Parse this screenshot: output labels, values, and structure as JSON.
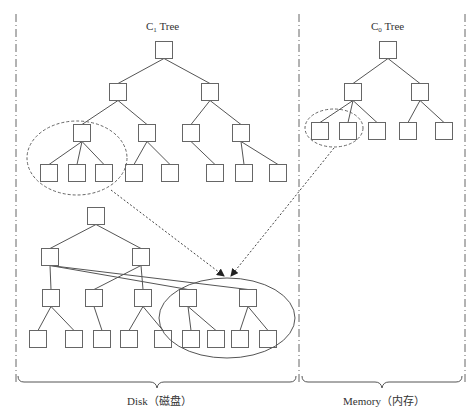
{
  "colors": {
    "line": "#555555",
    "box": "#666666",
    "dashed": "#666666",
    "arrow": "#222222",
    "text": "#333333",
    "background": "#ffffff"
  },
  "titles": {
    "c1_prefix": "C",
    "c1_sub": "1",
    "c1_suffix": " Tree",
    "c0_prefix": "C",
    "c0_sub": "0",
    "c0_suffix": " Tree"
  },
  "regions": {
    "disk_label": "Disk（磁盘）",
    "memory_label": "Memory（内存）"
  },
  "trees": {
    "c1_top": {
      "nodes": [
        [
          164,
          50
        ],
        [
          118,
          92
        ],
        [
          210,
          92
        ],
        [
          82,
          133
        ],
        [
          147,
          133
        ],
        [
          191,
          133
        ],
        [
          241,
          133
        ],
        [
          49,
          173
        ],
        [
          77,
          173
        ],
        [
          104,
          173
        ],
        [
          134,
          173
        ],
        [
          170,
          173
        ],
        [
          215,
          173
        ],
        [
          244,
          173
        ],
        [
          278,
          173
        ]
      ],
      "edges": [
        [
          0,
          1
        ],
        [
          0,
          2
        ],
        [
          1,
          3
        ],
        [
          1,
          4
        ],
        [
          2,
          5
        ],
        [
          2,
          6
        ],
        [
          3,
          7
        ],
        [
          3,
          8
        ],
        [
          3,
          9
        ],
        [
          4,
          10
        ],
        [
          4,
          11
        ],
        [
          5,
          12
        ],
        [
          6,
          13
        ],
        [
          6,
          14
        ]
      ]
    },
    "c0": {
      "nodes": [
        [
          388,
          50
        ],
        [
          353,
          92
        ],
        [
          420,
          92
        ],
        [
          320,
          131
        ],
        [
          348,
          131
        ],
        [
          377,
          131
        ],
        [
          408,
          131
        ],
        [
          444,
          131
        ]
      ],
      "edges": [
        [
          0,
          1
        ],
        [
          0,
          2
        ],
        [
          1,
          3
        ],
        [
          1,
          4
        ],
        [
          1,
          5
        ],
        [
          2,
          6
        ],
        [
          2,
          7
        ]
      ]
    },
    "c1_bottom": {
      "nodes": [
        [
          96,
          216
        ],
        [
          50,
          257
        ],
        [
          141,
          257
        ],
        [
          51,
          298
        ],
        [
          94,
          298
        ],
        [
          143,
          298
        ],
        [
          188,
          298
        ],
        [
          248,
          298
        ],
        [
          38,
          339
        ],
        [
          74,
          339
        ],
        [
          102,
          339
        ],
        [
          129,
          339
        ],
        [
          163,
          339
        ],
        [
          191,
          339
        ],
        [
          216,
          339
        ],
        [
          240,
          339
        ],
        [
          268,
          339
        ]
      ],
      "edges": [
        [
          0,
          1
        ],
        [
          0,
          2
        ],
        [
          1,
          3
        ],
        [
          1,
          6
        ],
        [
          1,
          7
        ],
        [
          2,
          4
        ],
        [
          2,
          5
        ],
        [
          3,
          8
        ],
        [
          3,
          9
        ],
        [
          4,
          10
        ],
        [
          5,
          11
        ],
        [
          5,
          12
        ],
        [
          6,
          13
        ],
        [
          6,
          14
        ],
        [
          7,
          15
        ],
        [
          7,
          16
        ]
      ]
    }
  }
}
